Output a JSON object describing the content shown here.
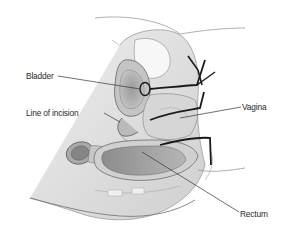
{
  "figure": {
    "type": "anatomical-illustration",
    "style": "grayscale pencil shading",
    "labels": [
      {
        "id": "bladder",
        "text": "Bladder"
      },
      {
        "id": "line_of_incision",
        "text": "Line of incision"
      },
      {
        "id": "vagina",
        "text": "Vagina"
      },
      {
        "id": "rectum",
        "text": "Rectum"
      }
    ]
  },
  "colors": {
    "background": "#ffffff",
    "label_text": "#2a2a2a",
    "leader_line": "#333333",
    "incision_line": "#1a1a1a",
    "tissue_light": "#e6e6e6",
    "tissue_mid": "#bdbdbd",
    "tissue_dark": "#8a8a8a"
  }
}
